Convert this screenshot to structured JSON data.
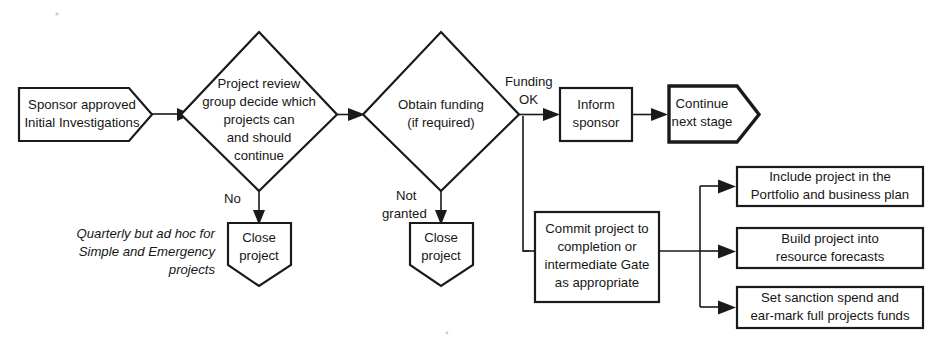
{
  "diagram": {
    "background_color": "#ffffff",
    "line_color": "#1a1a1a",
    "text_color": "#161616"
  },
  "nodes": {
    "start": {
      "shape": "chevron-pentagon",
      "line1": "Sponsor approved",
      "line2": "Initial Investigations"
    },
    "decision_review": {
      "shape": "diamond",
      "line1": "Project review",
      "line2": "group decide which",
      "line3": "projects can",
      "line4": "and should",
      "line5": "continue"
    },
    "decision_funding": {
      "shape": "diamond",
      "line1": "Obtain funding",
      "line2": "(if required)"
    },
    "inform_sponsor": {
      "shape": "rectangle",
      "line1": "Inform",
      "line2": "sponsor"
    },
    "continue_next_stage": {
      "shape": "chevron-pentagon",
      "line1": "Continue",
      "line2": "next stage"
    },
    "close_project_1": {
      "shape": "down-pentagon",
      "line1": "Close",
      "line2": "project"
    },
    "close_project_2": {
      "shape": "down-pentagon",
      "line1": "Close",
      "line2": "project"
    },
    "commit_project": {
      "shape": "rectangle",
      "line1": "Commit project to",
      "line2": "completion or",
      "line3": "intermediate Gate",
      "line4": "as appropriate"
    },
    "include_portfolio": {
      "shape": "rectangle",
      "line1": "Include project in the",
      "line2": "Portfolio and business plan"
    },
    "build_resource": {
      "shape": "rectangle",
      "line1": "Build project into",
      "line2": "resource forecasts"
    },
    "set_sanction": {
      "shape": "rectangle",
      "line1": "Set sanction spend and",
      "line2": "ear-mark full projects funds"
    }
  },
  "edge_labels": {
    "no": "No",
    "funding_ok_line1": "Funding",
    "funding_ok_line2": "OK",
    "not_granted_line1": "Not",
    "not_granted_line2": "granted"
  },
  "annotations": {
    "quarterly_note_line1": "Quarterly but ad hoc for",
    "quarterly_note_line2": "Simple and Emergency",
    "quarterly_note_line3": "projects"
  }
}
